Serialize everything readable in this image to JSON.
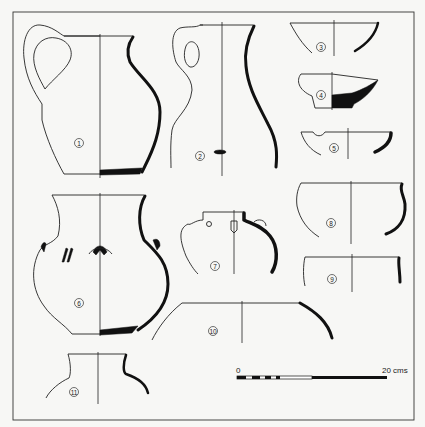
{
  "figure": {
    "background": "#f7f7f5",
    "ink_color": "#111111",
    "vessels": [
      {
        "id": 1,
        "label": "1",
        "type": "jug with handle"
      },
      {
        "id": 2,
        "label": "2",
        "type": "tall jug with handle"
      },
      {
        "id": 3,
        "label": "3",
        "type": "bowl"
      },
      {
        "id": 4,
        "label": "4",
        "type": "bowl, thick base"
      },
      {
        "id": 5,
        "label": "5",
        "type": "bowl"
      },
      {
        "id": 6,
        "label": "6",
        "type": "jar with lugs"
      },
      {
        "id": 7,
        "label": "7",
        "type": "globular jar with lugs"
      },
      {
        "id": 8,
        "label": "8",
        "type": "pot"
      },
      {
        "id": 9,
        "label": "9",
        "type": "pot rim"
      },
      {
        "id": 10,
        "label": "10",
        "type": "large vessel shoulder"
      },
      {
        "id": 11,
        "label": "11",
        "type": "jar neck"
      }
    ],
    "scale_bar": {
      "start_label": "0",
      "end_label": "20 cms"
    }
  }
}
